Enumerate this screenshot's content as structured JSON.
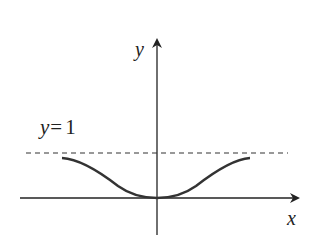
{
  "diagram": {
    "type": "function-graph",
    "axes": {
      "x_label": "x",
      "y_label": "y"
    },
    "asymptote": {
      "label_var": "y",
      "label_eq": "=",
      "label_val": "1",
      "style": "dashed"
    },
    "curve": {
      "description": "bell-inverted curve, minimum 0 at origin, approaching y=1 on both sides",
      "color": "#333333"
    },
    "colors": {
      "axis": "#222222",
      "curve": "#333333",
      "dashed": "#333333",
      "background": "#ffffff"
    }
  }
}
